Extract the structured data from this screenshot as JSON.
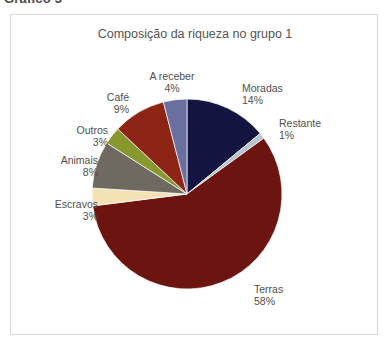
{
  "figure": {
    "caption": "Gráfico 3",
    "title": "Composição da riqueza no grupo 1"
  },
  "chart_data": {
    "type": "pie",
    "title": "Composição da riqueza no grupo 1",
    "xlabel": "",
    "ylabel": "",
    "unit": "%",
    "total": 100,
    "legend_position": "callout-labels",
    "grid": false,
    "start_angle_deg": 0,
    "direction": "clockwise",
    "categories": [
      "Moradas",
      "Restante",
      "Terras",
      "Escravos",
      "Animais",
      "Outros",
      "Café",
      "A receber"
    ],
    "values": [
      14,
      1,
      58,
      3,
      8,
      3,
      9,
      4
    ],
    "colors": [
      "#141440",
      "#b9c2cf",
      "#6b1410",
      "#f5e2b4",
      "#6e6a60",
      "#87992c",
      "#8e2416",
      "#6a6fa0"
    ],
    "slices": [
      {
        "name": "Moradas",
        "label": "Moradas",
        "percent": "14%",
        "value": 14,
        "color": "#141440",
        "label_position": "right"
      },
      {
        "name": "Restante",
        "label": "Restante",
        "percent": "1%",
        "value": 1,
        "color": "#b9c2cf",
        "label_position": "right"
      },
      {
        "name": "Terras",
        "label": "Terras",
        "percent": "58%",
        "value": 58,
        "color": "#6b1410",
        "label_position": "bottom-right"
      },
      {
        "name": "Escravos",
        "label": "Escravos",
        "percent": "3%",
        "value": 3,
        "color": "#f5e2b4",
        "label_position": "left"
      },
      {
        "name": "Animais",
        "label": "Animais",
        "percent": "8%",
        "value": 8,
        "color": "#6e6a60",
        "label_position": "left"
      },
      {
        "name": "Outros",
        "label": "Outros",
        "percent": "3%",
        "value": 3,
        "color": "#87992c",
        "label_position": "left"
      },
      {
        "name": "Café",
        "label": "Café",
        "percent": "9%",
        "value": 9,
        "color": "#8e2416",
        "label_position": "upper-left"
      },
      {
        "name": "A receber",
        "label": "A receber",
        "percent": "4%",
        "value": 4,
        "color": "#6a6fa0",
        "label_position": "top"
      }
    ]
  }
}
